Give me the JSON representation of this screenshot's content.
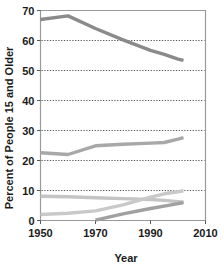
{
  "chart_data": {
    "type": "line",
    "title": "",
    "xlabel": "Year",
    "ylabel": "Percent of People 15 and Older",
    "xlim": [
      1950,
      2010
    ],
    "ylim": [
      0,
      70
    ],
    "xticks": [
      1950,
      1970,
      1990,
      2010
    ],
    "yticks": [
      0,
      10,
      20,
      30,
      40,
      50,
      60,
      70
    ],
    "grid": "horizontal-dotted",
    "legend": "none",
    "series": [
      {
        "name": "Married",
        "color": "#8a8a8a",
        "width": 3.4,
        "x": [
          1950,
          1960,
          1970,
          1980,
          1990,
          1995,
          2000,
          2002
        ],
        "values": [
          67.0,
          68.2,
          64.0,
          60.2,
          56.7,
          55.4,
          53.8,
          53.4
        ]
      },
      {
        "name": "Never Married",
        "color": "#a8a8a8",
        "width": 3.4,
        "x": [
          1950,
          1960,
          1970,
          1980,
          1990,
          1995,
          2000,
          2002
        ],
        "values": [
          22.6,
          22.0,
          24.9,
          25.4,
          25.8,
          26.0,
          27.1,
          27.6
        ]
      },
      {
        "name": "Widowed",
        "color": "#c4c4c4",
        "width": 3.4,
        "x": [
          1950,
          1960,
          1970,
          1980,
          1990,
          1995,
          2000,
          2002
        ],
        "values": [
          8.1,
          7.9,
          7.6,
          7.3,
          7.0,
          6.7,
          6.3,
          6.1
        ]
      },
      {
        "name": "Divorced",
        "color": "#c9c9c9",
        "width": 3.4,
        "x": [
          1950,
          1960,
          1970,
          1980,
          1990,
          1995,
          2000,
          2002
        ],
        "values": [
          2.0,
          2.4,
          3.2,
          5.2,
          7.8,
          8.9,
          9.6,
          9.9
        ]
      },
      {
        "name": "Separated",
        "color": "#a0a0a0",
        "width": 3.4,
        "x": [
          1970,
          1980,
          1990,
          1995,
          2000,
          2002
        ],
        "values": [
          0.1,
          2.2,
          4.0,
          4.8,
          5.6,
          6.0
        ]
      }
    ]
  },
  "axes": {
    "y_title": "Percent of People 15 and Older",
    "x_title": "Year",
    "y_tick_labels": [
      "0",
      "10",
      "20",
      "30",
      "40",
      "50",
      "60",
      "70"
    ],
    "x_tick_labels": [
      "1950",
      "1970",
      "1990",
      "2010"
    ]
  },
  "colors": {
    "text": "#1a1a1a",
    "border": "#9a9a9a",
    "grid": "#3a3a3a",
    "background": "#ffffff"
  }
}
